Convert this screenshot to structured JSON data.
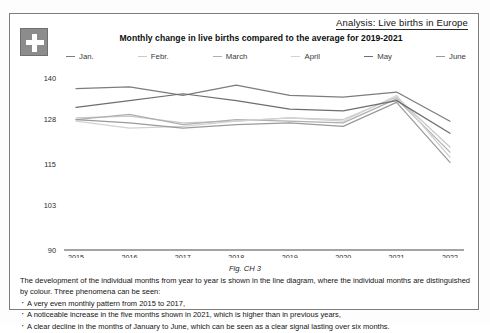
{
  "header": {
    "analysis_label": "Analysis: Live births in Europe"
  },
  "badge": {
    "name": "swiss-flag"
  },
  "chart_data": {
    "type": "line",
    "title": "Monthly change in live births compared to the average for 2019-2021",
    "xlabel": "",
    "ylabel": "",
    "categories": [
      "2015",
      "2016",
      "2017",
      "2018",
      "2019",
      "2020",
      "2021",
      "2022"
    ],
    "yticks": [
      90,
      103,
      115,
      128,
      140
    ],
    "ylim": [
      90,
      143
    ],
    "grid": false,
    "legend_position": "top",
    "series": [
      {
        "name": "Jan.",
        "color": "#7d7d7d",
        "values": [
          137.0,
          137.5,
          135.0,
          138.0,
          135.0,
          134.5,
          136.0,
          127.5
        ]
      },
      {
        "name": "Febr.",
        "color": "#c9c9c9",
        "values": [
          128.5,
          129.0,
          127.0,
          127.5,
          128.5,
          128.0,
          134.5,
          120.0
        ]
      },
      {
        "name": "March",
        "color": "#b0b0b0",
        "values": [
          128.0,
          129.5,
          126.5,
          128.0,
          127.5,
          127.0,
          134.0,
          118.5
        ]
      },
      {
        "name": "April",
        "color": "#d2d2d2",
        "values": [
          127.5,
          125.5,
          126.0,
          127.5,
          128.5,
          127.5,
          135.0,
          117.0
        ]
      },
      {
        "name": "May",
        "color": "#6e6e6e",
        "values": [
          131.5,
          133.5,
          135.5,
          133.5,
          131.0,
          130.5,
          133.5,
          124.0
        ]
      },
      {
        "name": "June",
        "color": "#9a9a9a",
        "values": [
          128.0,
          127.0,
          125.5,
          126.5,
          127.0,
          126.0,
          133.0,
          115.5
        ]
      }
    ]
  },
  "figure": {
    "caption": "Fig. CH 3"
  },
  "body": {
    "paragraph": "The development of the individual months from year to year is shown in the line diagram, where the individual months are distinguished by colour. Three phenomena can be seen:",
    "bullets": [
      "A very even monthly pattern from 2015 to 2017,",
      "A noticeable increase in the five months shown in 2021, which is higher than in previous years,",
      "A clear decline in the months of January to June, which can be seen as a clear signal lasting over six months."
    ]
  }
}
